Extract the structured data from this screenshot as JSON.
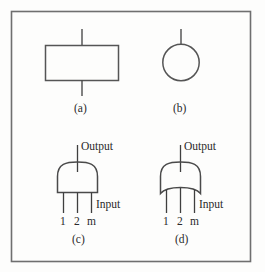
{
  "figure": {
    "background_color": "#fdfdfc",
    "frame_color": "#6b6b6b",
    "ink_color": "#3a3a3a",
    "text_color": "#2a2a2a",
    "panels": [
      {
        "id": "a",
        "caption": "(a)",
        "symbol": "rectangle-block",
        "description": "Rectangle with vertical lead at top and bottom"
      },
      {
        "id": "b",
        "caption": "(b)",
        "symbol": "circle-block",
        "description": "Circle with vertical lead at top"
      },
      {
        "id": "c",
        "caption": "(c)",
        "symbol": "and-gate",
        "description": "AND gate: domed top, flat bottom, three input leads",
        "output_label": "Output",
        "input_label": "Input",
        "pins": [
          "1",
          "2",
          "m"
        ]
      },
      {
        "id": "d",
        "caption": "(d)",
        "symbol": "or-gate",
        "description": "OR gate: domed top, concave bottom, three input leads",
        "output_label": "Output",
        "input_label": "Input",
        "pins": [
          "1",
          "2",
          "m"
        ]
      }
    ]
  }
}
